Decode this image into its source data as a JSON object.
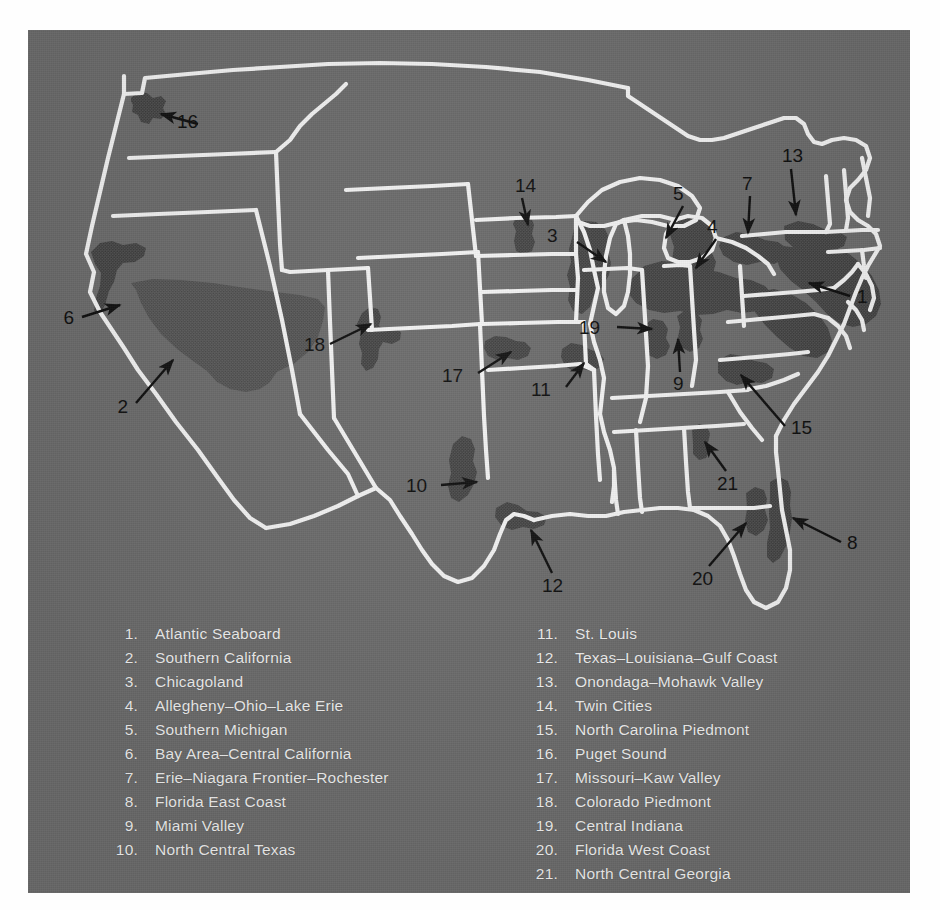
{
  "figure": {
    "kind": "thematic-map",
    "region": "United States"
  },
  "colors": {
    "paper": "#ffffff",
    "panel_background": "#6b6b6b",
    "state_border": "#f4f4f4",
    "urban_shading": "#4a4a4a",
    "urban_shading_light": "#575757",
    "label_text": "#111111",
    "legend_text": "#f2f2f2"
  },
  "map": {
    "callouts": [
      {
        "id": 1,
        "label": "1",
        "name": "Atlantic Seaboard"
      },
      {
        "id": 2,
        "label": "2",
        "name": "Southern California"
      },
      {
        "id": 3,
        "label": "3",
        "name": "Chicagoland"
      },
      {
        "id": 4,
        "label": "4",
        "name": "Allegheny-Ohio-Lake Erie"
      },
      {
        "id": 5,
        "label": "5",
        "name": "Southern Michigan"
      },
      {
        "id": 6,
        "label": "6",
        "name": "Bay Area-Central California"
      },
      {
        "id": 7,
        "label": "7",
        "name": "Erie-Niagara Frontier-Rochester"
      },
      {
        "id": 8,
        "label": "8",
        "name": "Florida East Coast"
      },
      {
        "id": 9,
        "label": "9",
        "name": "Miami Valley"
      },
      {
        "id": 10,
        "label": "10",
        "name": "North Central Texas"
      },
      {
        "id": 11,
        "label": "11",
        "name": "St. Louis"
      },
      {
        "id": 12,
        "label": "12",
        "name": "Texas-Louisiana-Gulf Coast"
      },
      {
        "id": 13,
        "label": "13",
        "name": "Onondaga-Mohawk Valley"
      },
      {
        "id": 14,
        "label": "14",
        "name": "Twin Cities"
      },
      {
        "id": 15,
        "label": "15",
        "name": "North Carolina Piedmont"
      },
      {
        "id": 16,
        "label": "16",
        "name": "Puget Sound"
      },
      {
        "id": 17,
        "label": "17",
        "name": "Missouri-Kaw Valley"
      },
      {
        "id": 18,
        "label": "18",
        "name": "Colorado Piedmont"
      },
      {
        "id": 19,
        "label": "19",
        "name": "Central Indiana"
      },
      {
        "id": 20,
        "label": "20",
        "name": "Florida West Coast"
      },
      {
        "id": 21,
        "label": "21",
        "name": "North Central Georgia"
      }
    ]
  },
  "legend": {
    "left_column": [
      {
        "num": "1.",
        "label": "Atlantic Seaboard"
      },
      {
        "num": "2.",
        "label": "Southern California"
      },
      {
        "num": "3.",
        "label": "Chicagoland"
      },
      {
        "num": "4.",
        "label": "Allegheny–Ohio–Lake Erie"
      },
      {
        "num": "5.",
        "label": "Southern Michigan"
      },
      {
        "num": "6.",
        "label": "Bay Area–Central California"
      },
      {
        "num": "7.",
        "label": "Erie–Niagara Frontier–Rochester"
      },
      {
        "num": "8.",
        "label": "Florida East Coast"
      },
      {
        "num": "9.",
        "label": "Miami Valley"
      },
      {
        "num": "10.",
        "label": "North Central Texas"
      }
    ],
    "right_column": [
      {
        "num": "11.",
        "label": "St. Louis"
      },
      {
        "num": "12.",
        "label": "Texas–Louisiana–Gulf Coast"
      },
      {
        "num": "13.",
        "label": "Onondaga–Mohawk Valley"
      },
      {
        "num": "14.",
        "label": "Twin Cities"
      },
      {
        "num": "15.",
        "label": "North Carolina Piedmont"
      },
      {
        "num": "16.",
        "label": "Puget Sound"
      },
      {
        "num": "17.",
        "label": "Missouri–Kaw Valley"
      },
      {
        "num": "18.",
        "label": "Colorado Piedmont"
      },
      {
        "num": "19.",
        "label": "Central Indiana"
      },
      {
        "num": "20.",
        "label": "Florida West Coast"
      },
      {
        "num": "21.",
        "label": "North Central Georgia"
      }
    ]
  }
}
